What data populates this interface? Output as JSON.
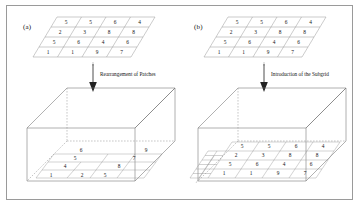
{
  "figure": {
    "background_color": "#ffffff",
    "frame_color": "#9a9a9a",
    "line_color": "#8d8d8d",
    "text_color": "#151515"
  },
  "panels": [
    {
      "id": "a",
      "label": "(a)",
      "arrow_label": "Rearrangement of Patches",
      "top_grid": {
        "rows": 4,
        "cols": 4,
        "values": [
          [
            5,
            5,
            6,
            4
          ],
          [
            2,
            3,
            8,
            8
          ],
          [
            5,
            6,
            4,
            6
          ],
          [
            1,
            1,
            9,
            7
          ]
        ]
      },
      "bottom_box": {
        "description": "3D box with rearranged patches on base plane",
        "patch_rows": [
          [
            6,
            9
          ],
          [
            5,
            7
          ],
          [
            4,
            8
          ],
          [
            1,
            2,
            5
          ]
        ]
      }
    },
    {
      "id": "b",
      "label": "(b)",
      "arrow_label": "Introduction of the Subgrid",
      "top_grid": {
        "rows": 4,
        "cols": 4,
        "values": [
          [
            5,
            5,
            6,
            4
          ],
          [
            2,
            3,
            8,
            8
          ],
          [
            5,
            6,
            4,
            6
          ],
          [
            1,
            1,
            9,
            7
          ]
        ]
      },
      "bottom_box": {
        "description": "3D box containing full grid plus refined subgrid at left",
        "grid_values": [
          [
            5,
            5,
            6,
            4
          ],
          [
            2,
            3,
            8,
            8
          ],
          [
            5,
            6,
            4,
            6
          ],
          [
            1,
            1,
            9,
            7
          ]
        ],
        "subgrid_present": true
      }
    }
  ]
}
